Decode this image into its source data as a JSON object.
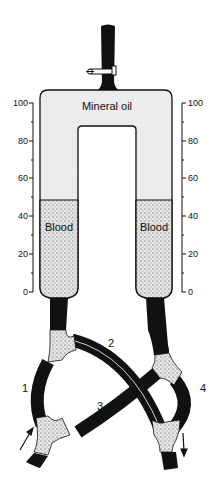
{
  "diagram": {
    "labels": {
      "oil": "Mineral oil",
      "blood_left": "Blood",
      "blood_right": "Blood"
    },
    "scale_left": {
      "ticks": [
        "100",
        "80",
        "60",
        "40",
        "20",
        "0"
      ]
    },
    "scale_right": {
      "ticks": [
        "100",
        "80",
        "60",
        "40",
        "20",
        "0"
      ]
    },
    "tubes": {
      "t1": "1",
      "t2": "2",
      "t3": "3",
      "t4": "4"
    },
    "blood_level_percent": 48,
    "colors": {
      "ink": "#111111",
      "oil": "#ebebeb",
      "blood": "#cfcfcf",
      "background": "#ffffff"
    }
  }
}
